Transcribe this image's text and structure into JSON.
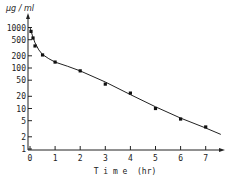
{
  "chart_data": {
    "type": "scatter",
    "title": "",
    "xlabel": "T i m e  (hr)",
    "ylabel": "µg / ml",
    "yscale": "log",
    "xlim": [
      0,
      7.6
    ],
    "ylim": [
      1,
      1500
    ],
    "x_ticks": [
      0,
      1,
      2,
      3,
      4,
      5,
      6,
      7
    ],
    "y_ticks": [
      1,
      2,
      5,
      10,
      20,
      50,
      100,
      200,
      500,
      1000
    ],
    "y_tick_labels": [
      "1",
      "2",
      "5",
      "10",
      "20",
      "50",
      "100",
      "200",
      "500",
      "1000"
    ],
    "grid": false,
    "legend": null,
    "series": [
      {
        "name": "measured concentration",
        "x": [
          0.04,
          0.12,
          0.2,
          0.5,
          1,
          2,
          3,
          4,
          5,
          6,
          7
        ],
        "y": [
          800,
          550,
          350,
          210,
          140,
          85,
          40,
          24,
          10,
          5.5,
          3.5
        ]
      }
    ],
    "fit_curve": {
      "name": "fitted biexponential curve",
      "x": [
        0,
        0.1,
        0.2,
        0.35,
        0.5,
        0.75,
        1,
        1.5,
        2,
        3,
        4,
        5,
        6,
        7,
        7.6
      ],
      "y": [
        1000,
        620,
        420,
        280,
        215,
        170,
        140,
        110,
        85,
        45,
        22,
        11,
        5.8,
        3.3,
        2.3
      ]
    }
  }
}
